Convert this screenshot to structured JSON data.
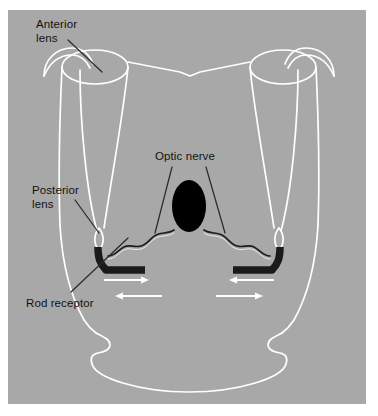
{
  "figure": {
    "panel": {
      "background_color": "#a8a8a8",
      "page_background_color": "#ffffff",
      "outline_color": "#ffffff",
      "label_color": "#121212",
      "leader_line_color": "#2b2b2b",
      "receptor_color": "#1a1a1a",
      "optic_nerve_color": "#000000",
      "arrow_color": "#ffffff"
    },
    "labels": [
      {
        "id": "anterior-lens",
        "text": "Anterior\nlens",
        "line1": "Anterior",
        "line2": "lens"
      },
      {
        "id": "posterior-lens",
        "text": "Posterior\nlens",
        "line1": "Posterior",
        "line2": "lens"
      },
      {
        "id": "rod-receptor",
        "text": "Rod receptor",
        "line1": "Rod receptor",
        "line2": ""
      },
      {
        "id": "optic-nerve",
        "text": "Optic nerve",
        "line1": "Optic nerve",
        "line2": ""
      }
    ],
    "parts": {
      "anterior_lens_label": "Anterior lens",
      "posterior_lens_label": "Posterior lens",
      "rod_receptor_label": "Rod receptor",
      "optic_nerve_label": "Optic nerve"
    },
    "arrows": [
      {
        "id": "arrow-upper-left",
        "direction": "right"
      },
      {
        "id": "arrow-upper-right",
        "direction": "left"
      },
      {
        "id": "arrow-lower-left",
        "direction": "left"
      },
      {
        "id": "arrow-lower-right",
        "direction": "right"
      }
    ]
  }
}
